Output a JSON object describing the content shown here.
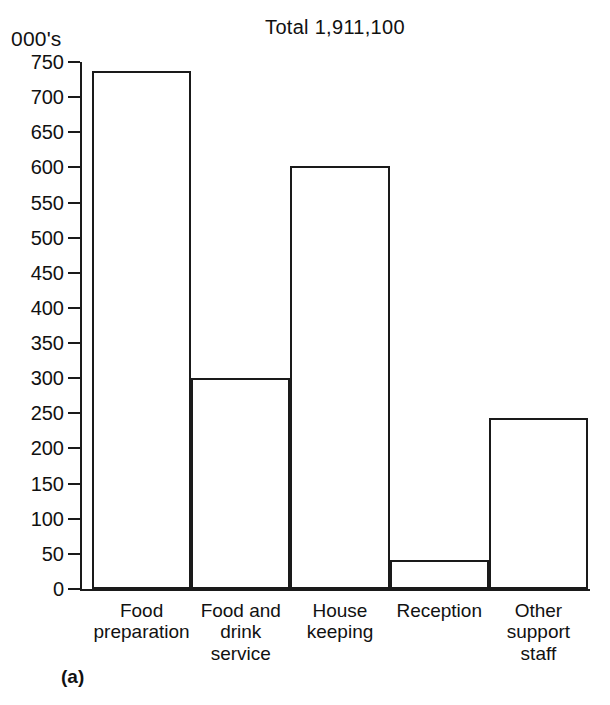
{
  "figure": {
    "tag": "(a)",
    "title": "Total 1,911,100",
    "unit_label": "000's"
  },
  "chart_data": {
    "type": "bar",
    "title": "Total 1,911,100",
    "xlabel": "",
    "ylabel": "000's",
    "ylim": [
      0,
      750
    ],
    "grid": false,
    "legend": "none",
    "orientation": "vertical",
    "bar_style": "outlined-contiguous",
    "categories": [
      "Food preparation",
      "Food and drink service",
      "House keeping",
      "Reception",
      "Other support staff"
    ],
    "category_label_lines": [
      [
        "Food",
        "preparation"
      ],
      [
        "Food and",
        "drink",
        "service"
      ],
      [
        "House",
        "keeping"
      ],
      [
        "Reception"
      ],
      [
        "Other",
        "support",
        "staff"
      ]
    ],
    "values": [
      737,
      301,
      602,
      42,
      244
    ],
    "value_units": "thousands",
    "yticks": [
      0,
      50,
      100,
      150,
      200,
      250,
      300,
      350,
      400,
      450,
      500,
      550,
      600,
      650,
      700,
      750
    ],
    "ytick_labels": [
      "0",
      "50",
      "100",
      "150",
      "200",
      "250",
      "300",
      "350",
      "400",
      "450",
      "500",
      "550",
      "600",
      "650",
      "700",
      "750"
    ],
    "total_annotation": "Total 1,911,100"
  },
  "colors": {
    "ink": "#1a1a1a",
    "paper": "#ffffff"
  }
}
